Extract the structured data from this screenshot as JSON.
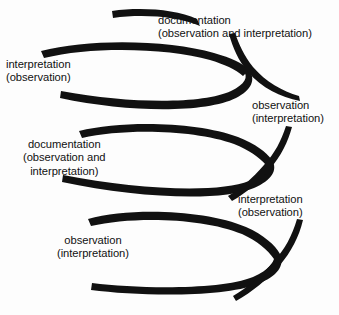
{
  "diagram": {
    "type": "spiral-cycle-diagram",
    "stroke_color": "#111111",
    "background_color": "#fdfdfd",
    "width": 339,
    "height": 315,
    "loop_count": 3,
    "crossing_count": 3,
    "labels": [
      {
        "id": "documentation-top",
        "lines": [
          "documentation",
          "(observation and interpretation)"
        ],
        "align": "left"
      },
      {
        "id": "interpretation-left",
        "lines": [
          "interpretation",
          "(observation)"
        ],
        "align": "left"
      },
      {
        "id": "observation-right",
        "lines": [
          "observation",
          "(interpretation)"
        ],
        "align": "left"
      },
      {
        "id": "documentation-middle",
        "lines": [
          "documentation",
          "(observation and",
          "interpretation)"
        ],
        "align": "center"
      },
      {
        "id": "interpretation-right",
        "lines": [
          "interpretation",
          "(observation)"
        ],
        "align": "left"
      },
      {
        "id": "observation-bottom",
        "lines": [
          "observation",
          "(interpretation)"
        ],
        "align": "center"
      }
    ]
  }
}
